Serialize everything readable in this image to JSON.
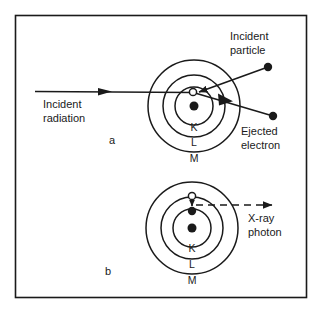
{
  "figure": {
    "background_color": "#ffffff",
    "ink_color": "#1a1a1a",
    "frame": {
      "x": 15,
      "y": 15,
      "width": 292,
      "height": 283
    }
  },
  "panels": [
    {
      "id": "a",
      "label": "a",
      "label_pos": {
        "x": 112,
        "y": 144
      },
      "atom": {
        "center": {
          "x": 194,
          "y": 106
        },
        "nucleus_radius": 4.5,
        "shells": [
          {
            "name": "K",
            "radius": 19,
            "label_pos": {
              "x": 194,
              "y": 131
            }
          },
          {
            "name": "L",
            "radius": 31,
            "label_pos": {
              "x": 194,
              "y": 146
            }
          },
          {
            "name": "M",
            "radius": 46,
            "label_pos": {
              "x": 194,
              "y": 162
            }
          }
        ],
        "vacancy": {
          "x": 193,
          "y": 92,
          "radius": 3.6,
          "filled": false
        }
      },
      "annotations": [
        {
          "name": "incident-radiation",
          "text": "Incident\nradiation",
          "lines": [
            "Incident",
            "radiation"
          ],
          "text_pos": {
            "x": 43,
            "y": 108
          },
          "arrow": {
            "x1": 35,
            "y1": 91,
            "x2": 193,
            "y2": 92,
            "style": "solid",
            "head": "mid"
          }
        },
        {
          "name": "incident-particle",
          "text": "Incident\nparticle",
          "lines": [
            "Incident",
            "particle"
          ],
          "text_pos": {
            "x": 230,
            "y": 40
          },
          "particle_dot": {
            "x": 268,
            "y": 67,
            "radius": 4.2
          },
          "arrow": {
            "x1": 268,
            "y1": 67,
            "x2": 196,
            "y2": 93,
            "style": "solid",
            "head": "end"
          }
        },
        {
          "name": "ejected-electron",
          "text": "Ejected\nelectron",
          "lines": [
            "Ejected",
            "electron"
          ],
          "text_pos": {
            "x": 241,
            "y": 135
          },
          "particle_dot": {
            "x": 273,
            "y": 116,
            "radius": 4.2
          },
          "arrow": {
            "x1": 195,
            "y1": 93,
            "x2": 273,
            "y2": 116,
            "style": "solid",
            "head": "mid"
          }
        }
      ]
    },
    {
      "id": "b",
      "label": "b",
      "label_pos": {
        "x": 108,
        "y": 275
      },
      "atom": {
        "center": {
          "x": 192,
          "y": 228
        },
        "nucleus_radius": 4.5,
        "shells": [
          {
            "name": "K",
            "radius": 19,
            "label_pos": {
              "x": 192,
              "y": 252
            }
          },
          {
            "name": "L",
            "radius": 31,
            "label_pos": {
              "x": 192,
              "y": 268
            }
          },
          {
            "name": "M",
            "radius": 46,
            "label_pos": {
              "x": 192,
              "y": 284
            }
          }
        ],
        "vacancy": {
          "x": 192,
          "y": 196,
          "radius": 3.6,
          "filled": false
        },
        "electron_drop": {
          "name": "electron-transition",
          "from": {
            "x": 192,
            "y": 199
          },
          "to": {
            "x": 192,
            "y": 209
          },
          "landing_dot": {
            "x": 192,
            "y": 211,
            "radius": 4.2
          }
        }
      },
      "annotations": [
        {
          "name": "x-ray-photon",
          "text": "X-ray\nphoton",
          "lines": [
            "X-ray",
            "photon"
          ],
          "text_pos": {
            "x": 248,
            "y": 222
          },
          "arrow": {
            "x1": 196,
            "y1": 205,
            "x2": 278,
            "y2": 205,
            "style": "dashed",
            "head": "end"
          }
        }
      ]
    }
  ]
}
